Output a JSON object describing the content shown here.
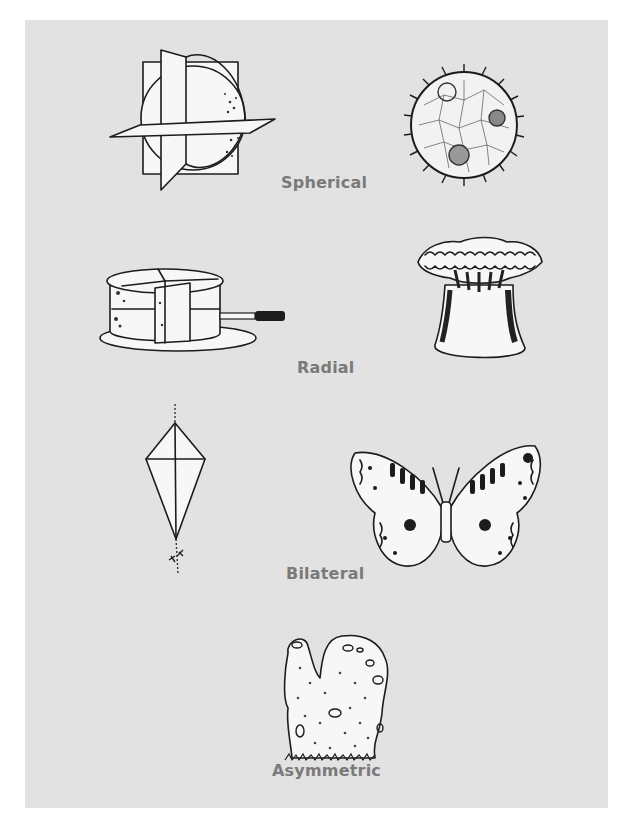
{
  "figure": {
    "background_color": "#e2e2e2",
    "label_color": "#7a7a7a",
    "sections": [
      {
        "label": "Spherical",
        "illustrations": [
          {
            "name": "sphere-with-cutting-planes",
            "description": "Sphere bisected by three intersecting planes"
          },
          {
            "name": "volvox-colony",
            "description": "Spherical colonial organism with cilia"
          }
        ]
      },
      {
        "label": "Radial",
        "illustrations": [
          {
            "name": "sliced-layer-cake",
            "description": "Round two-layer cake cut into wedges with a knife, on a plate"
          },
          {
            "name": "sea-anemone",
            "description": "Sea anemone with ring of tentacles"
          }
        ]
      },
      {
        "label": "Bilateral",
        "illustrations": [
          {
            "name": "kite",
            "description": "Diamond kite with string and tail"
          },
          {
            "name": "butterfly",
            "description": "Patterned butterfly with mirrored wings"
          }
        ]
      },
      {
        "label": "Asymmetric",
        "illustrations": [
          {
            "name": "sponge",
            "description": "Irregular sponge with pores and oscula"
          }
        ]
      }
    ]
  }
}
